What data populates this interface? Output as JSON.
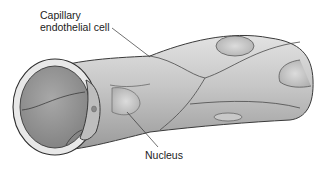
{
  "figure": {
    "colors": {
      "background": "#ffffff",
      "tube_light": "#d4d4d4",
      "tube_mid": "#b4b4b4",
      "tube_dark": "#8c8c8c",
      "outline": "#3a3a3a",
      "label_text": "#222222"
    }
  },
  "labels": {
    "cell_line1": "Capillary",
    "cell_line2": "endothelial cell",
    "nucleus": "Nucleus"
  }
}
